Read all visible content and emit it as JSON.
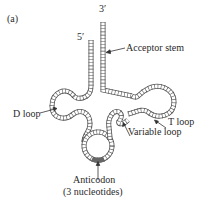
{
  "panel_label": "(a)",
  "diagram": {
    "ends": {
      "three_prime": "3′",
      "five_prime": "5′"
    },
    "labels": {
      "acceptor_stem": "Acceptor stem",
      "d_loop": "D loop",
      "t_loop": "T loop",
      "variable_loop": "Variable loop",
      "anticodon": "Anticodon",
      "anticodon_note": "(3 nucleotides)"
    }
  }
}
